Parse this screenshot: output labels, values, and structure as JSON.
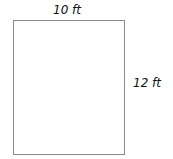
{
  "diagram": {
    "shape": "rectangle",
    "width_label": "10 ft",
    "height_label": "12 ft",
    "stroke_color": "#8a8a8a"
  }
}
